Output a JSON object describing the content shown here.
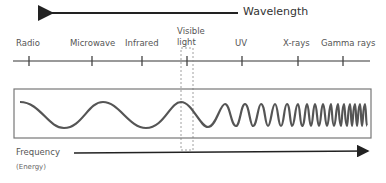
{
  "diagram": {
    "title_arrow": {
      "label": "Wavelength",
      "direction": "left"
    },
    "bands": [
      {
        "label": "Radio",
        "tick_x": 29
      },
      {
        "label": "Microwave",
        "tick_x": 92
      },
      {
        "label": "Infrared",
        "tick_x": 142
      },
      {
        "label": "Visible light",
        "line1": "Visible",
        "line2": "light",
        "tick_x": 187
      },
      {
        "label": "UV",
        "tick_x": 242
      },
      {
        "label": "X-rays",
        "tick_x": 298
      },
      {
        "label": "Gamma rays",
        "tick_x": 343
      }
    ],
    "frequency_arrow": {
      "label": "Frequency",
      "sublabel": "(Energy)",
      "direction": "right"
    },
    "colors": {
      "lines": "#333333",
      "wave": "#555555",
      "box": "#777777",
      "text": "#555555"
    }
  }
}
